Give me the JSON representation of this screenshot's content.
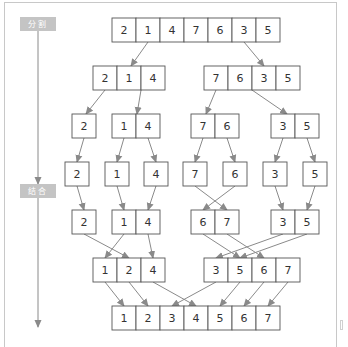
{
  "diagram": {
    "phases": [
      {
        "label": "分割",
        "x": 20,
        "y": 17,
        "w": 36,
        "h": 14
      },
      {
        "label": "结合",
        "x": 20,
        "y": 184,
        "w": 36,
        "h": 14
      }
    ],
    "timeline": {
      "x": 38,
      "y1": 31,
      "y2": 327,
      "mid_arrow_y": 182
    },
    "cell_width": 24,
    "cell_height": 24,
    "arrays": [
      {
        "id": "r0",
        "row": 0,
        "x": 112,
        "y": 18,
        "values": [
          2,
          1,
          4,
          7,
          6,
          3,
          5
        ]
      },
      {
        "id": "r1a",
        "row": 1,
        "x": 93,
        "y": 66,
        "values": [
          2,
          1,
          4
        ]
      },
      {
        "id": "r1b",
        "row": 1,
        "x": 204,
        "y": 66,
        "values": [
          7,
          6,
          3,
          5
        ]
      },
      {
        "id": "r2a",
        "row": 2,
        "x": 72,
        "y": 114,
        "values": [
          2
        ]
      },
      {
        "id": "r2b",
        "row": 2,
        "x": 112,
        "y": 114,
        "values": [
          1,
          4
        ]
      },
      {
        "id": "r2c",
        "row": 2,
        "x": 191,
        "y": 114,
        "values": [
          7,
          6
        ]
      },
      {
        "id": "r2d",
        "row": 2,
        "x": 271,
        "y": 114,
        "values": [
          3,
          5
        ]
      },
      {
        "id": "r3a",
        "row": 3,
        "x": 65,
        "y": 162,
        "values": [
          2
        ]
      },
      {
        "id": "r3b",
        "row": 3,
        "x": 105,
        "y": 162,
        "values": [
          1
        ]
      },
      {
        "id": "r3c",
        "row": 3,
        "x": 144,
        "y": 162,
        "values": [
          4
        ]
      },
      {
        "id": "r3d",
        "row": 3,
        "x": 183,
        "y": 162,
        "values": [
          7
        ]
      },
      {
        "id": "r3e",
        "row": 3,
        "x": 223,
        "y": 162,
        "values": [
          6
        ]
      },
      {
        "id": "r3f",
        "row": 3,
        "x": 263,
        "y": 162,
        "values": [
          3
        ]
      },
      {
        "id": "r3g",
        "row": 3,
        "x": 303,
        "y": 162,
        "values": [
          5
        ]
      },
      {
        "id": "r4a",
        "row": 4,
        "x": 72,
        "y": 210,
        "values": [
          2
        ]
      },
      {
        "id": "r4b",
        "row": 4,
        "x": 112,
        "y": 210,
        "values": [
          1,
          4
        ]
      },
      {
        "id": "r4c",
        "row": 4,
        "x": 191,
        "y": 210,
        "values": [
          6,
          7
        ]
      },
      {
        "id": "r4d",
        "row": 4,
        "x": 271,
        "y": 210,
        "values": [
          3,
          5
        ]
      },
      {
        "id": "r5a",
        "row": 5,
        "x": 93,
        "y": 258,
        "values": [
          1,
          2,
          4
        ]
      },
      {
        "id": "r5b",
        "row": 5,
        "x": 204,
        "y": 258,
        "values": [
          3,
          5,
          6,
          7
        ]
      },
      {
        "id": "r6",
        "row": 6,
        "x": 112,
        "y": 306,
        "values": [
          1,
          2,
          3,
          4,
          5,
          6,
          7
        ]
      }
    ],
    "edges": [
      [
        148,
        42,
        131,
        66
      ],
      [
        244,
        42,
        264,
        66
      ],
      [
        105,
        90,
        86,
        114
      ],
      [
        141,
        90,
        137,
        114
      ],
      [
        216,
        90,
        206,
        114
      ],
      [
        252,
        90,
        287,
        114
      ],
      [
        84,
        138,
        77,
        162
      ],
      [
        124,
        138,
        117,
        162
      ],
      [
        148,
        138,
        156,
        162
      ],
      [
        203,
        138,
        195,
        162
      ],
      [
        227,
        138,
        235,
        162
      ],
      [
        283,
        138,
        275,
        162
      ],
      [
        307,
        138,
        315,
        162
      ],
      [
        77,
        186,
        84,
        210
      ],
      [
        117,
        186,
        124,
        210
      ],
      [
        156,
        186,
        148,
        210
      ],
      [
        195,
        186,
        227,
        210
      ],
      [
        235,
        186,
        203,
        210
      ],
      [
        275,
        186,
        283,
        210
      ],
      [
        315,
        186,
        307,
        210
      ],
      [
        84,
        234,
        129,
        258
      ],
      [
        124,
        234,
        105,
        258
      ],
      [
        148,
        234,
        153,
        258
      ],
      [
        203,
        234,
        240,
        258
      ],
      [
        227,
        234,
        264,
        258
      ],
      [
        283,
        234,
        216,
        258
      ],
      [
        307,
        234,
        240,
        258
      ],
      [
        105,
        282,
        124,
        306
      ],
      [
        129,
        282,
        148,
        306
      ],
      [
        153,
        282,
        196,
        306
      ],
      [
        216,
        282,
        172,
        306
      ],
      [
        240,
        282,
        220,
        306
      ],
      [
        264,
        282,
        244,
        306
      ],
      [
        288,
        282,
        268,
        306
      ]
    ]
  },
  "colors": {
    "cell_stroke": "#555555",
    "edge": "#8a8a8a",
    "phase_label_bg": "#c4c4c4",
    "phase_label_text": "#ffffff"
  }
}
